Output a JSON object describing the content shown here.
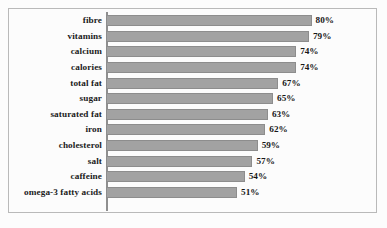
{
  "chart_data": {
    "type": "bar",
    "orientation": "horizontal",
    "title": "",
    "subtitle": "",
    "xlabel": "",
    "ylabel": "",
    "xlim": [
      0,
      80
    ],
    "grid": false,
    "legend": null,
    "value_suffix": "%",
    "categories": [
      "fibre",
      "vitamins",
      "calcium",
      "calories",
      "total fat",
      "sugar",
      "saturated fat",
      "iron",
      "cholesterol",
      "salt",
      "caffeine",
      "omega-3 fatty acids"
    ],
    "values": [
      80,
      79,
      74,
      74,
      67,
      65,
      63,
      62,
      59,
      57,
      54,
      51
    ],
    "value_labels": [
      "80%",
      "79%",
      "74%",
      "74%",
      "67%",
      "65%",
      "63%",
      "62%",
      "59%",
      "57%",
      "54%",
      "51%"
    ],
    "bars": [
      {
        "category": "fibre",
        "value": 80,
        "label": "80%"
      },
      {
        "category": "vitamins",
        "value": 79,
        "label": "79%"
      },
      {
        "category": "calcium",
        "value": 74,
        "label": "74%"
      },
      {
        "category": "calories",
        "value": 74,
        "label": "74%"
      },
      {
        "category": "total fat",
        "value": 67,
        "label": "67%"
      },
      {
        "category": "sugar",
        "value": 65,
        "label": "65%"
      },
      {
        "category": "saturated fat",
        "value": 63,
        "label": "63%"
      },
      {
        "category": "iron",
        "value": 62,
        "label": "62%"
      },
      {
        "category": "cholesterol",
        "value": 59,
        "label": "59%"
      },
      {
        "category": "salt",
        "value": 57,
        "label": "57%"
      },
      {
        "category": "caffeine",
        "value": 54,
        "label": "54%"
      },
      {
        "category": "omega-3 fatty acids",
        "value": 51,
        "label": "51%"
      }
    ],
    "colors": {
      "bar_fill": "#a2a2a2",
      "bar_stroke": "#8d8d8d",
      "axis_line": "#8f8f8f",
      "frame_border": "#b9b9b9",
      "background": "#fcfcfc",
      "text": "#1b1b1b"
    },
    "scale": {
      "px_per_unit": 2.57,
      "axis_origin_value": 0,
      "max_value": 80
    }
  }
}
